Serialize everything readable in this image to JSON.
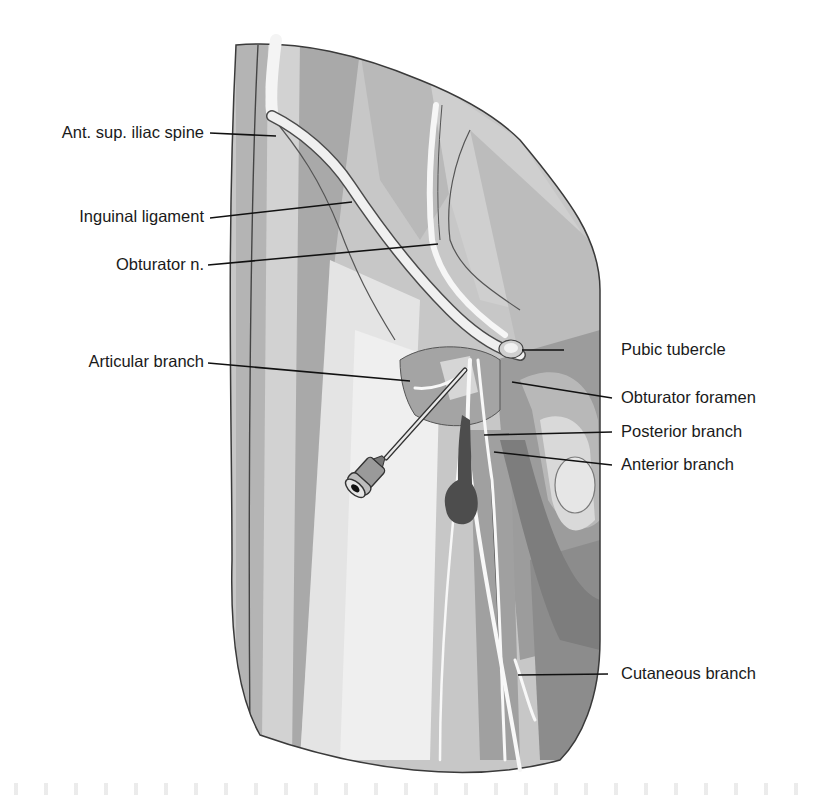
{
  "figure": {
    "colors": {
      "background": "#ffffff",
      "skin_light": "#e6e6e6",
      "tissue_mid": "#bdbdbd",
      "tissue_dark": "#8f8f8f",
      "nerve": "#f2f2f2",
      "outline": "#2b2b2b",
      "leader_line": "#111111",
      "label_text": "#1a1a1a"
    }
  },
  "labels": {
    "left": [
      {
        "id": "asis",
        "text": "Ant. sup. iliac spine"
      },
      {
        "id": "inguinal",
        "text": "Inguinal ligament"
      },
      {
        "id": "obturator_n",
        "text": "Obturator n."
      },
      {
        "id": "articular",
        "text": "Articular branch"
      }
    ],
    "right": [
      {
        "id": "pubic",
        "text": "Pubic tubercle"
      },
      {
        "id": "foramen",
        "text": "Obturator foramen"
      },
      {
        "id": "posterior",
        "text": "Posterior branch"
      },
      {
        "id": "anterior",
        "text": "Anterior branch"
      },
      {
        "id": "cutaneous",
        "text": "Cutaneous branch"
      }
    ]
  }
}
